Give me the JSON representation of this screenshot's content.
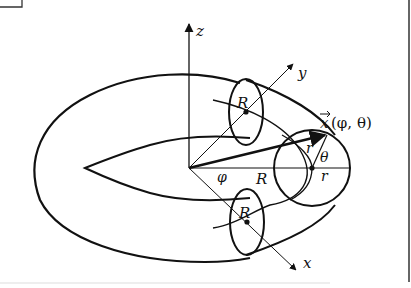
{
  "figure": {
    "type": "torus-parametrization-diagram",
    "labels": {
      "z_axis": "z",
      "y_axis": "y",
      "x_axis": "x",
      "position_vector": "x⃗(φ, θ)",
      "vector_symbol": "x",
      "vector_args": "(φ, θ)",
      "major_radius_top": "R",
      "major_radius_bottom": "R",
      "major_radius_center": "R",
      "minor_radius_upper": "r",
      "minor_radius_right": "r",
      "azimuth_angle": "φ",
      "poloidal_angle": "θ"
    },
    "colors": {
      "stroke": "#111111",
      "background": "#ffffff"
    }
  }
}
